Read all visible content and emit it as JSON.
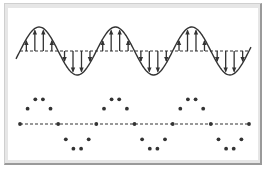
{
  "diagram": {
    "title": "",
    "colors": {
      "stroke": "#333333",
      "dots": "#333333",
      "frame": "#9a9a9a",
      "frame_fill": "#e6e6e6",
      "panel": "#ffffff"
    },
    "continuous_wave": {
      "type": "sine",
      "periods": 3,
      "arrows_per_half_period": 4,
      "arrow_direction_positive": "up",
      "arrow_direction_negative": "down",
      "baseline_style": "dashed"
    },
    "sampled_wave": {
      "type": "sine",
      "periods": 3,
      "samples_per_period": 10,
      "marker": "dot",
      "baseline_style": "dashed"
    }
  }
}
